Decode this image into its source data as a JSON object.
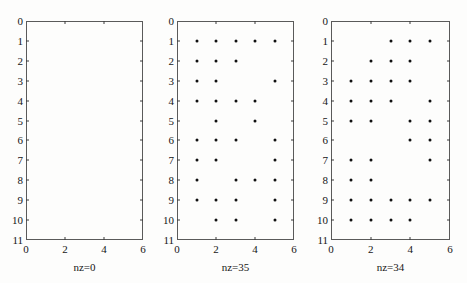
{
  "figure": {
    "top_title": "",
    "background_color": "#fdfdfc",
    "axis_color": "#5a5a5a",
    "dot_color": "#101010"
  },
  "chart_data": [
    {
      "type": "scatter",
      "title": "",
      "subtitle": "nz=0",
      "xlabel": "",
      "ylabel": "",
      "xlim": [
        0,
        6
      ],
      "ylim": [
        11,
        0
      ],
      "y_inverted": true,
      "grid": false,
      "legend": null,
      "xticks": [
        0,
        2,
        4,
        6
      ],
      "xtick_labels": [
        "0",
        "2",
        "4",
        "6"
      ],
      "yticks": [
        0,
        1,
        2,
        3,
        4,
        5,
        6,
        7,
        8,
        9,
        10,
        11
      ],
      "ytick_labels": [
        "0",
        "1",
        "2",
        "3",
        "4",
        "5",
        "6",
        "7",
        "8",
        "9",
        "10",
        "11"
      ],
      "x": [],
      "y": [],
      "nz": 0,
      "nz_label": "nz=0"
    },
    {
      "type": "scatter",
      "title": "",
      "subtitle": "nz=35",
      "xlabel": "",
      "ylabel": "",
      "xlim": [
        0,
        6
      ],
      "ylim": [
        11,
        0
      ],
      "y_inverted": true,
      "grid": false,
      "legend": null,
      "xticks": [
        0,
        2,
        4,
        6
      ],
      "xtick_labels": [
        "0",
        "2",
        "4",
        "6"
      ],
      "yticks": [
        0,
        1,
        2,
        3,
        4,
        5,
        6,
        7,
        8,
        9,
        10,
        11
      ],
      "ytick_labels": [
        "0",
        "1",
        "2",
        "3",
        "4",
        "5",
        "6",
        "7",
        "8",
        "9",
        "10",
        "11"
      ],
      "x": [
        1,
        2,
        3,
        4,
        5,
        1,
        2,
        3,
        1,
        2,
        5,
        1,
        2,
        3,
        4,
        2,
        4,
        1,
        2,
        3,
        5,
        1,
        2,
        5,
        1,
        3,
        4,
        5,
        1,
        2,
        3,
        5,
        2,
        3,
        5
      ],
      "y": [
        1,
        1,
        1,
        1,
        1,
        2,
        2,
        2,
        3,
        3,
        3,
        4,
        4,
        4,
        4,
        5,
        5,
        6,
        6,
        6,
        6,
        7,
        7,
        7,
        8,
        8,
        8,
        8,
        9,
        9,
        9,
        9,
        10,
        10,
        10
      ],
      "nz": 35,
      "nz_label": "nz=35"
    },
    {
      "type": "scatter",
      "title": "",
      "subtitle": "nz=34",
      "xlabel": "",
      "ylabel": "",
      "xlim": [
        0,
        6
      ],
      "ylim": [
        11,
        0
      ],
      "y_inverted": true,
      "grid": false,
      "legend": null,
      "xticks": [
        0,
        2,
        4,
        6
      ],
      "xtick_labels": [
        "0",
        "2",
        "4",
        "6"
      ],
      "yticks": [
        0,
        1,
        2,
        3,
        4,
        5,
        6,
        7,
        8,
        9,
        10,
        11
      ],
      "ytick_labels": [
        "0",
        "1",
        "2",
        "3",
        "4",
        "5",
        "6",
        "7",
        "8",
        "9",
        "10",
        "11"
      ],
      "x": [
        3,
        4,
        5,
        2,
        3,
        4,
        1,
        2,
        3,
        4,
        1,
        2,
        3,
        5,
        1,
        2,
        4,
        5,
        4,
        5,
        1,
        2,
        5,
        1,
        2,
        1,
        2,
        3,
        4,
        5,
        1,
        2,
        3,
        4
      ],
      "y": [
        1,
        1,
        1,
        2,
        2,
        2,
        3,
        3,
        3,
        3,
        4,
        4,
        4,
        4,
        5,
        5,
        5,
        5,
        6,
        6,
        7,
        7,
        7,
        8,
        8,
        9,
        9,
        9,
        9,
        9,
        10,
        10,
        10,
        10
      ],
      "nz": 34,
      "nz_label": "nz=34"
    }
  ]
}
